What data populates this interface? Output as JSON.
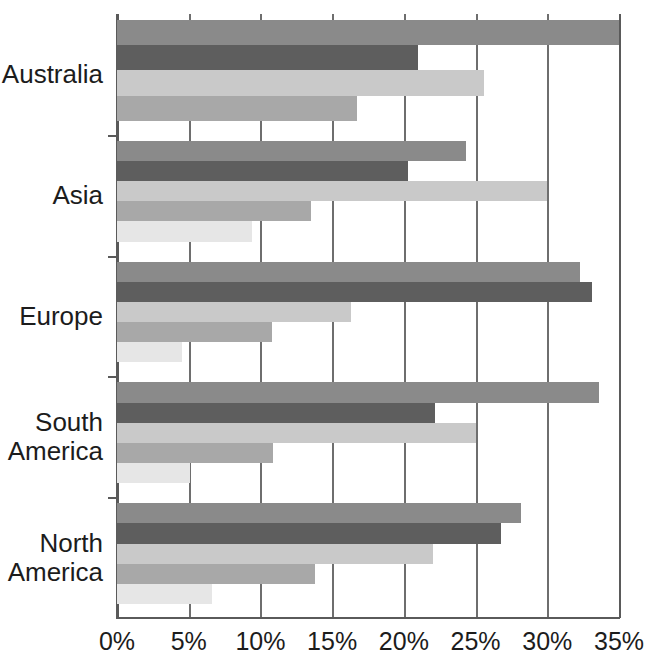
{
  "chart_data": {
    "type": "bar",
    "orientation": "horizontal",
    "title": "",
    "xlabel": "",
    "ylabel": "",
    "xlim": [
      0,
      35
    ],
    "xtick_labels": [
      "0%",
      "5%",
      "10%",
      "15%",
      "20%",
      "25%",
      "30%",
      "35%"
    ],
    "xtick_values": [
      0,
      5,
      10,
      15,
      20,
      25,
      30,
      35
    ],
    "grid": true,
    "legend": "none",
    "categories": [
      "Australia",
      "Asia",
      "Europe",
      "South America",
      "North America"
    ],
    "series": [
      {
        "name": "series-1",
        "color": "#8a8a8a",
        "values": [
          35.0,
          24.3,
          32.3,
          33.6,
          28.2
        ]
      },
      {
        "name": "series-2",
        "color": "#5e5e5e",
        "values": [
          21.0,
          20.3,
          33.1,
          22.2,
          26.8
        ]
      },
      {
        "name": "series-3",
        "color": "#c9c9c9",
        "values": [
          25.6,
          30.0,
          16.3,
          25.0,
          22.0
        ]
      },
      {
        "name": "series-4",
        "color": "#a8a8a8",
        "values": [
          16.7,
          13.5,
          10.8,
          10.9,
          13.8
        ]
      },
      {
        "name": "series-5",
        "color": "#e6e6e6",
        "values": [
          null,
          9.4,
          4.5,
          5.1,
          6.6
        ]
      }
    ],
    "groups": [
      {
        "label": "Australia",
        "label_lines": [
          "Australia"
        ],
        "bars": [
          {
            "series": "series-1",
            "value": 35.0,
            "color": "#8a8a8a"
          },
          {
            "series": "series-2",
            "value": 21.0,
            "color": "#5e5e5e"
          },
          {
            "series": "series-3",
            "value": 25.6,
            "color": "#c9c9c9"
          },
          {
            "series": "series-4",
            "value": 16.7,
            "color": "#a8a8a8"
          }
        ]
      },
      {
        "label": "Asia",
        "label_lines": [
          "Asia"
        ],
        "bars": [
          {
            "series": "series-1",
            "value": 24.3,
            "color": "#8a8a8a"
          },
          {
            "series": "series-2",
            "value": 20.3,
            "color": "#5e5e5e"
          },
          {
            "series": "series-3",
            "value": 30.0,
            "color": "#c9c9c9"
          },
          {
            "series": "series-4",
            "value": 13.5,
            "color": "#a8a8a8"
          },
          {
            "series": "series-5",
            "value": 9.4,
            "color": "#e6e6e6"
          }
        ]
      },
      {
        "label": "Europe",
        "label_lines": [
          "Europe"
        ],
        "bars": [
          {
            "series": "series-1",
            "value": 32.3,
            "color": "#8a8a8a"
          },
          {
            "series": "series-2",
            "value": 33.1,
            "color": "#5e5e5e"
          },
          {
            "series": "series-3",
            "value": 16.3,
            "color": "#c9c9c9"
          },
          {
            "series": "series-4",
            "value": 10.8,
            "color": "#a8a8a8"
          },
          {
            "series": "series-5",
            "value": 4.5,
            "color": "#e6e6e6"
          }
        ]
      },
      {
        "label": "South America",
        "label_lines": [
          "South",
          "America"
        ],
        "bars": [
          {
            "series": "series-1",
            "value": 33.6,
            "color": "#8a8a8a"
          },
          {
            "series": "series-2",
            "value": 22.2,
            "color": "#5e5e5e"
          },
          {
            "series": "series-3",
            "value": 25.0,
            "color": "#c9c9c9"
          },
          {
            "series": "series-4",
            "value": 10.9,
            "color": "#a8a8a8"
          },
          {
            "series": "series-5",
            "value": 5.1,
            "color": "#e6e6e6"
          }
        ]
      },
      {
        "label": "North America",
        "label_lines": [
          "North",
          "America"
        ],
        "bars": [
          {
            "series": "series-1",
            "value": 28.2,
            "color": "#8a8a8a"
          },
          {
            "series": "series-2",
            "value": 26.8,
            "color": "#5e5e5e"
          },
          {
            "series": "series-3",
            "value": 22.0,
            "color": "#c9c9c9"
          },
          {
            "series": "series-4",
            "value": 13.8,
            "color": "#a8a8a8"
          },
          {
            "series": "series-5",
            "value": 6.6,
            "color": "#e6e6e6"
          }
        ]
      }
    ]
  },
  "axis": {
    "line_color": "#5a5a5a",
    "grid_color": "#6e6e6e"
  }
}
